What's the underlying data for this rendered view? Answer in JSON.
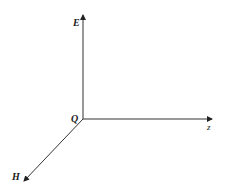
{
  "diagram": {
    "type": "3d-axes",
    "origin_label": "Q",
    "axes": [
      {
        "name": "E",
        "direction": "up"
      },
      {
        "name": "z",
        "direction": "right"
      },
      {
        "name": "H",
        "direction": "down-left"
      }
    ],
    "colors": {
      "line": "#333333",
      "background": "#ffffff"
    }
  }
}
